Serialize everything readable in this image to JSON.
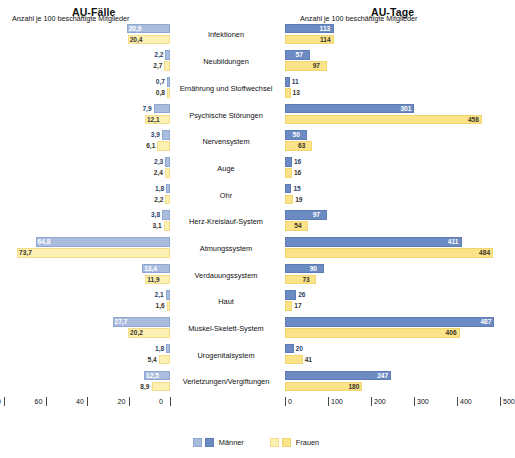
{
  "panels": {
    "left_title": "AU-Fälle",
    "right_title": "AU-Tage"
  },
  "axis": {
    "left_title": "Anzahl je 100 beschäftigte Mitglieder",
    "right_title": "Anzahl je 100 beschäftigte Mitglieder",
    "left_ticks": [
      "80",
      "60",
      "40",
      "20",
      "0"
    ],
    "right_ticks": [
      "0",
      "100",
      "200",
      "300",
      "400",
      "500"
    ]
  },
  "legend": {
    "items": [
      {
        "label": "Männer",
        "color_light": "#aabddf",
        "color_dark": "#6d8bc3"
      },
      {
        "label": "Frauen",
        "color_light": "#fdf0b3",
        "color_dark": "#fbe38a"
      }
    ]
  },
  "chart_data": {
    "type": "bar",
    "orientation": "horizontal-diverging",
    "xlabel": "Anzahl je 100 beschäftigte Mitglieder",
    "ylabel": "",
    "grid": false,
    "legend_position": "bottom-center",
    "panels": [
      {
        "name": "AU-Fälle",
        "side": "left",
        "direction": "right-to-left",
        "xlim": [
          0,
          80
        ],
        "ticks": [
          80,
          60,
          40,
          20,
          0
        ],
        "axis_label": "Anzahl je 100 beschäftigte Mitglieder"
      },
      {
        "name": "AU-Tage",
        "side": "right",
        "direction": "left-to-right",
        "xlim": [
          0,
          500
        ],
        "ticks": [
          0,
          100,
          200,
          300,
          400,
          500
        ],
        "axis_label": "Anzahl je 100 beschäftigte Mitglieder"
      }
    ],
    "categories": [
      "Infektionen",
      "Neubildungen",
      "Ernährung und Stoffwechsel",
      "Psychische Störungen",
      "Nervensystem",
      "Auge",
      "Ohr",
      "Herz-Kreislauf-System",
      "Atmungssystem",
      "Verdauungssystem",
      "Haut",
      "Muskel-Skelett-System",
      "Urogenitalsystem",
      "Verletzungen/Vergiftungen"
    ],
    "series": [
      {
        "name": "Männer",
        "panel": "AU-Fälle",
        "values": [
          20.9,
          2.2,
          0.7,
          7.9,
          3.9,
          2.3,
          1.8,
          3.8,
          64.8,
          13.4,
          2.1,
          27.7,
          1.8,
          12.5
        ]
      },
      {
        "name": "Frauen",
        "panel": "AU-Fälle",
        "values": [
          20.4,
          2.7,
          0.8,
          12.1,
          6.1,
          2.4,
          2.2,
          3.1,
          73.7,
          11.9,
          1.6,
          20.2,
          5.4,
          8.9
        ]
      },
      {
        "name": "Männer",
        "panel": "AU-Tage",
        "values": [
          113,
          57,
          11,
          301,
          50,
          16,
          15,
          97,
          411,
          90,
          26,
          487,
          20,
          247
        ]
      },
      {
        "name": "Frauen",
        "panel": "AU-Tage",
        "values": [
          114,
          97,
          13,
          458,
          63,
          16,
          19,
          54,
          484,
          73,
          17,
          406,
          41,
          180
        ]
      }
    ],
    "value_labels": {
      "faelle_maenner": [
        "20,9",
        "2,2",
        "0,7",
        "7,9",
        "3,9",
        "2,3",
        "1,8",
        "3,8",
        "64,8",
        "13,4",
        "2,1",
        "27,7",
        "1,8",
        "12,5"
      ],
      "faelle_frauen": [
        "20,4",
        "2,7",
        "0,8",
        "12,1",
        "6,1",
        "2,4",
        "2,2",
        "3,1",
        "73,7",
        "11,9",
        "1,6",
        "20,2",
        "5,4",
        "8,9"
      ],
      "tage_maenner": [
        "113",
        "57",
        "11",
        "301",
        "50",
        "16",
        "15",
        "97",
        "411",
        "90",
        "26",
        "487",
        "20",
        "247"
      ],
      "tage_frauen": [
        "114",
        "97",
        "13",
        "458",
        "63",
        "16",
        "19",
        "54",
        "484",
        "73",
        "17",
        "406",
        "41",
        "180"
      ]
    }
  }
}
